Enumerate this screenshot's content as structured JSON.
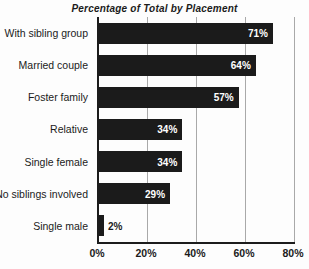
{
  "title": "Percentage of Total by Placement",
  "chart_data": {
    "type": "bar",
    "orientation": "horizontal",
    "title": "Percentage of Total by Placement",
    "categories": [
      "With sibling group",
      "Married couple",
      "Foster family",
      "Relative",
      "Single female",
      "No siblings involved",
      "Single male"
    ],
    "values": [
      71,
      64,
      57,
      34,
      34,
      29,
      2
    ],
    "value_labels": [
      "71%",
      "64%",
      "57%",
      "34%",
      "34%",
      "29%",
      "2%"
    ],
    "xlabel": "",
    "ylabel": "",
    "xlim": [
      0,
      80
    ],
    "x_ticks": [
      {
        "value": 0,
        "label": "0%"
      },
      {
        "value": 20,
        "label": "20%"
      },
      {
        "value": 40,
        "label": "40%"
      },
      {
        "value": 60,
        "label": "60%"
      },
      {
        "value": 80,
        "label": "80%"
      }
    ],
    "grid": "vertical-gridlines-at-nonzero-ticks",
    "legend": "none",
    "inside_label_threshold": 10,
    "colors": {
      "bar": "#1b1b1b",
      "gridline": "#a9a9a9",
      "axis": "#1c1c1c",
      "label_inside": "#ffffff",
      "label_outside": "#1b1b1b",
      "background": "#fdfdfd",
      "text": "#1b1b1b"
    }
  }
}
